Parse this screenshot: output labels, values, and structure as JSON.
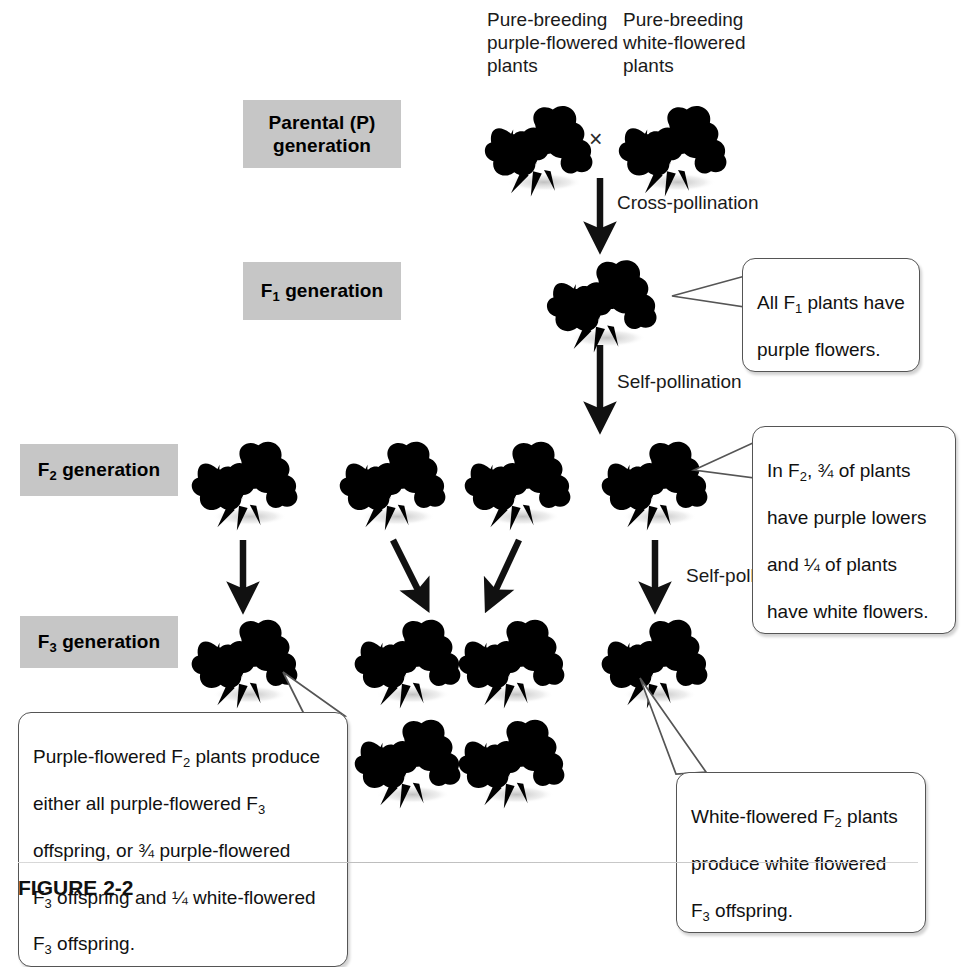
{
  "figure": {
    "caption": "FIGURE 2-2"
  },
  "generations": [
    {
      "id": "parental",
      "label": "Parental (P)\ngeneration",
      "sub": ""
    },
    {
      "id": "f1",
      "label": "F1 generation",
      "base": "F",
      "sub": "1",
      "rest": " generation"
    },
    {
      "id": "f2",
      "label": "F2 generation",
      "base": "F",
      "sub": "2",
      "rest": " generation"
    },
    {
      "id": "f3",
      "label": "F3 generation",
      "base": "F",
      "sub": "3",
      "rest": " generation"
    }
  ],
  "parent_labels": {
    "purple": "Pure-breeding\npurple-flowered\nplants",
    "white": "Pure-breeding\nwhite-flowered\nplants",
    "cross_symbol": "×"
  },
  "process_labels": {
    "cross_pollination": "Cross-pollination",
    "self_pollination_f1": "Self-pollination",
    "self_pollination_f2": "Self-pollination"
  },
  "callouts": {
    "f1": {
      "line1_pre": "All F",
      "line1_sub": "1",
      "line1_post": " plants have",
      "line2": "purple flowers."
    },
    "f2": {
      "line1_pre": "In F",
      "line1_sub": "2",
      "line1_post": ", ¾ of plants",
      "line2": "have purple lowers",
      "line3": "and ¼ of plants",
      "line4": "have white flowers."
    },
    "f3_purple": {
      "line1_pre": "Purple-flowered F",
      "line1_sub": "2",
      "line1_post": " plants produce",
      "line2_pre": "either all purple-flowered F",
      "line2_sub": "3",
      "line3": "offspring, or ¾ purple-flowered",
      "line4_pre": "F",
      "line4_sub": "3",
      "line4_post": " offspring and ¼ white-flowered",
      "line5_pre": "F",
      "line5_sub": "3",
      "line5_post": " offspring."
    },
    "f3_white": {
      "line1_pre": "White-flowered F",
      "line1_sub": "2",
      "line1_post": " plants",
      "line2": "produce white flowered",
      "line3_pre": "F",
      "line3_sub": "3",
      "line3_post": " offspring."
    }
  },
  "flowers": {
    "purple_color": "#4a4450",
    "white_color": "#f2f2f2",
    "parental_purple": {
      "x": 478,
      "y": 92,
      "size": 110,
      "color": "purple"
    },
    "parental_white": {
      "x": 612,
      "y": 92,
      "size": 110,
      "color": "white"
    },
    "f1": {
      "x": 548,
      "y": 248,
      "size": 112,
      "color": "purple"
    },
    "f2_row": [
      {
        "x": 190,
        "y": 430,
        "size": 110,
        "color": "purple"
      },
      {
        "x": 345,
        "y": 430,
        "size": 110,
        "color": "purple"
      },
      {
        "x": 465,
        "y": 430,
        "size": 110,
        "color": "purple"
      },
      {
        "x": 600,
        "y": 430,
        "size": 110,
        "color": "white"
      }
    ],
    "f3_rows": [
      {
        "x": 190,
        "y": 608,
        "size": 110,
        "color": "purple"
      },
      {
        "x": 358,
        "y": 608,
        "size": 110,
        "color": "purple"
      },
      {
        "x": 462,
        "y": 608,
        "size": 110,
        "color": "purple"
      },
      {
        "x": 600,
        "y": 608,
        "size": 110,
        "color": "white"
      },
      {
        "x": 358,
        "y": 710,
        "size": 110,
        "color": "purple"
      },
      {
        "x": 462,
        "y": 710,
        "size": 110,
        "color": "white"
      }
    ]
  },
  "arrows": [
    {
      "id": "arrow-cross-pollination",
      "x1": 600,
      "y1": 176,
      "x2": 600,
      "y2": 244
    },
    {
      "id": "arrow-self-pollination-f1",
      "x1": 600,
      "y1": 338,
      "x2": 600,
      "y2": 424
    },
    {
      "id": "arrow-f2-1-to-f3",
      "x1": 245,
      "y1": 532,
      "x2": 245,
      "y2": 600
    },
    {
      "id": "arrow-f2-2-to-f3",
      "x1": 392,
      "y1": 532,
      "x2": 418,
      "y2": 600
    },
    {
      "id": "arrow-f2-3-to-f3",
      "x1": 517,
      "y1": 532,
      "x2": 495,
      "y2": 600
    },
    {
      "id": "arrow-f2-4-to-f3",
      "x1": 655,
      "y1": 532,
      "x2": 655,
      "y2": 600
    }
  ],
  "colors": {
    "label_chip_bg": "#c6c6c6",
    "callout_border": "#555555",
    "arrow": "#111111",
    "page_bg": "#ffffff"
  }
}
